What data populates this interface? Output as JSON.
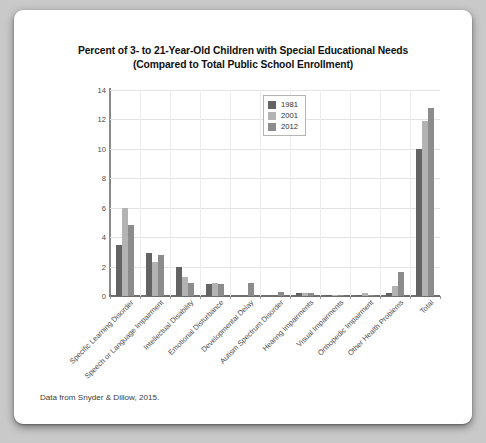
{
  "card": {
    "title_line1": "Percent of 3- to 21-Year-Old Children with Special Educational Needs",
    "title_line2": "(Compared to Total Public School Enrollment)",
    "caption": "Data from Snyder & Dillow, 2015."
  },
  "legend": {
    "position": "top-center",
    "entries": [
      {
        "label": "1981",
        "color": "#636363"
      },
      {
        "label": "2001",
        "color": "#b3b3b3"
      },
      {
        "label": "2012",
        "color": "#8c8c8c"
      }
    ]
  },
  "chart_data": {
    "type": "bar",
    "title": "Percent of 3- to 21-Year-Old Children with Special Educational Needs (Compared to Total Public School Enrollment)",
    "xlabel": "",
    "ylabel": "",
    "ylim": [
      0,
      14
    ],
    "yticks": [
      0,
      2,
      4,
      6,
      8,
      10,
      12,
      14
    ],
    "grid": true,
    "legend_position": "top-center",
    "categories": [
      "Specific Learning Disorder",
      "Speech or Language Impairment",
      "Intellectual Disability",
      "Emotional Disturbance",
      "Developmental Delay",
      "Autism Spectrum Disorder",
      "Hearing Impairments",
      "Visual Impairments",
      "Orthopedic Impairment",
      "Other Health Problems",
      "Total"
    ],
    "series": [
      {
        "name": "1981",
        "color": "#636363",
        "values": [
          3.5,
          2.9,
          2.0,
          0.8,
          0,
          0,
          0.2,
          0.1,
          0.1,
          0.2,
          10.0
        ]
      },
      {
        "name": "2001",
        "color": "#b3b3b3",
        "values": [
          6.0,
          2.3,
          1.3,
          0.9,
          0,
          0,
          0.2,
          0.1,
          0.2,
          0.7,
          11.9
        ]
      },
      {
        "name": "2012",
        "color": "#8c8c8c",
        "values": [
          4.8,
          2.8,
          0.9,
          0.8,
          0.9,
          0.3,
          0.2,
          0.1,
          0.1,
          1.6,
          12.8
        ]
      }
    ]
  }
}
